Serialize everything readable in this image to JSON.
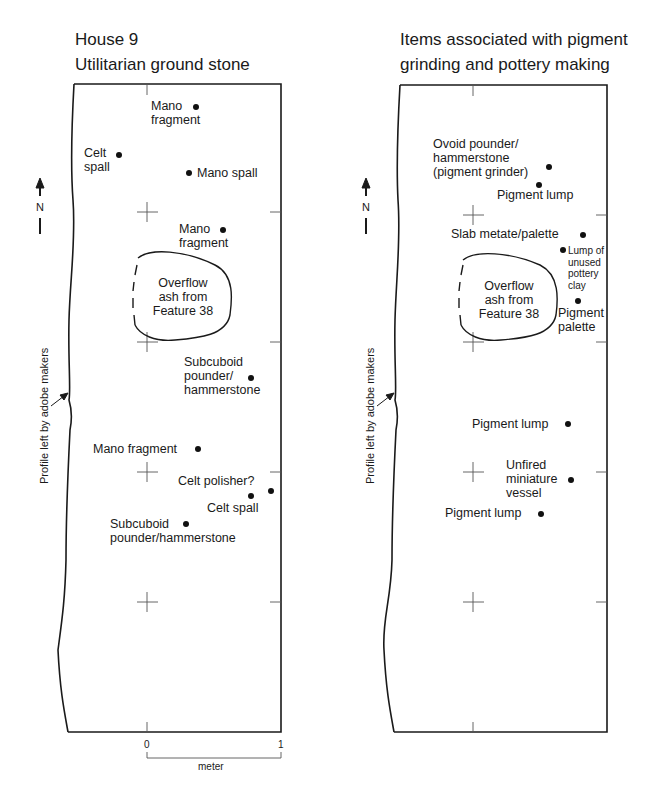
{
  "left_panel": {
    "title_line1": "House 9",
    "title_line2": "Utilitarian ground stone",
    "side_note": "Profile left by adobe makers",
    "north_label": "N",
    "feature": {
      "line1": "Overflow",
      "line2": "ash from",
      "line3": "Feature 38"
    },
    "items": [
      {
        "l1": "Mano",
        "l2": "fragment"
      },
      {
        "l1": "Celt",
        "l2": "spall"
      },
      {
        "l1": "Mano spall"
      },
      {
        "l1": "Mano",
        "l2": "fragment"
      },
      {
        "l1": "Subcuboid",
        "l2": "pounder/",
        "l3": "hammerstone"
      },
      {
        "l1": "Mano fragment"
      },
      {
        "l1": "Celt polisher?"
      },
      {
        "l1": "Celt spall"
      },
      {
        "l1": "Subcuboid",
        "l2": "pounder/hammerstone"
      }
    ]
  },
  "right_panel": {
    "title_line1": "Items associated with pigment",
    "title_line2": "grinding and pottery making",
    "side_note": "Profile left by adobe makers",
    "north_label": "N",
    "feature": {
      "line1": "Overflow",
      "line2": "ash from",
      "line3": "Feature 38"
    },
    "items": [
      {
        "l1": "Ovoid pounder/",
        "l2": "hammerstone",
        "l3": "(pigment grinder)"
      },
      {
        "l1": "Pigment lump"
      },
      {
        "l1": "Slab metate/palette"
      },
      {
        "l1": "Lump of",
        "l2": "unused",
        "l3": "pottery",
        "l4": "clay"
      },
      {
        "l1": "Pigment",
        "l2": "palette"
      },
      {
        "l1": "Pigment lump"
      },
      {
        "l1": "Unfired",
        "l2": "miniature",
        "l3": "vessel"
      },
      {
        "l1": "Pigment lump"
      }
    ]
  },
  "scale_bar": {
    "start": "0",
    "end": "1",
    "unit": "meter"
  },
  "colors": {
    "ink": "#1a1a1a",
    "grid": "#555555",
    "background": "#ffffff"
  }
}
